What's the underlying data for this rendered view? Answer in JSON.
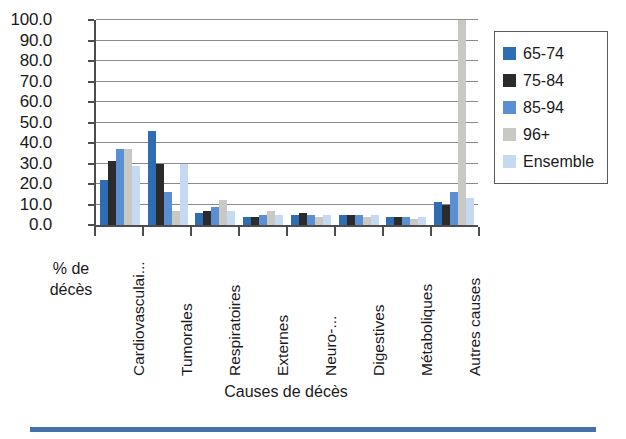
{
  "chart_data": {
    "type": "bar",
    "title": "",
    "xlabel": "Causes de décès",
    "ylabel": "% de décès",
    "ylim": [
      0,
      100
    ],
    "yticks": [
      "0.0",
      "10.0",
      "20.0",
      "30.0",
      "40.0",
      "50.0",
      "60.0",
      "70.0",
      "80.0",
      "90.0",
      "100.0"
    ],
    "grid": true,
    "legend_position": "right",
    "categories": [
      "Cardiovasculai...",
      "Tumorales",
      "Respiratoires",
      "Externes",
      "Neuro-...",
      "Digestives",
      "Métaboliques",
      "Autres causes"
    ],
    "series": [
      {
        "name": "65-74",
        "color": "#2e6db4",
        "values": [
          22,
          46,
          6,
          4,
          5,
          5,
          4,
          11
        ]
      },
      {
        "name": "75-84",
        "color": "#2b2b2b",
        "values": [
          31,
          30,
          7,
          4,
          6,
          5,
          4,
          10
        ]
      },
      {
        "name": "85-94",
        "color": "#5b8fd4",
        "values": [
          37,
          16,
          9,
          5,
          5,
          5,
          4,
          16
        ]
      },
      {
        "name": "96+",
        "color": "#c8c8c4",
        "values": [
          37,
          7,
          12,
          7,
          4,
          4,
          3,
          100
        ]
      },
      {
        "name": "Ensemble",
        "color": "#c5d9f1",
        "values": [
          29,
          30,
          7,
          5,
          5,
          5,
          4,
          13
        ]
      }
    ]
  },
  "axes": {
    "y_title_line1": "% de",
    "y_title_line2": "décès",
    "x_title": "Causes de décès"
  },
  "legend": {
    "items": [
      {
        "label": "65-74",
        "color": "#2e6db4"
      },
      {
        "label": "75-84",
        "color": "#2b2b2b"
      },
      {
        "label": "85-94",
        "color": "#5b8fd4"
      },
      {
        "label": "96+",
        "color": "#c8c8c4"
      },
      {
        "label": "Ensemble",
        "color": "#c5d9f1"
      }
    ]
  },
  "colors": {
    "axis": "#4d4d4d",
    "grid": "#8c8c8c",
    "rule": "#4472a8"
  }
}
